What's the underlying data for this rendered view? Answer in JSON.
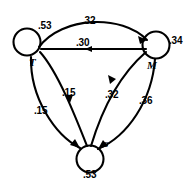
{
  "diagram": {
    "type": "state-transition-diagram",
    "nodes": [
      {
        "id": "T",
        "label": "T",
        "self_loop_label": ".53",
        "cx": 28,
        "cy": 42,
        "r": 14
      },
      {
        "id": "M",
        "label": "M",
        "self_loop_label": ".34",
        "cx": 155,
        "cy": 45,
        "r": 14
      },
      {
        "id": "S",
        "label": "s",
        "self_loop_label": ".53",
        "cx": 90,
        "cy": 158,
        "r": 14
      }
    ],
    "edges": [
      {
        "id": "T-M-top",
        "from": "T",
        "to": "M",
        "label": ".32"
      },
      {
        "id": "M-T-mid",
        "from": "M",
        "to": "T",
        "label": ".30"
      },
      {
        "id": "T-S-inner",
        "from": "T",
        "to": "S",
        "label": ".15"
      },
      {
        "id": "T-S-outer",
        "from": "T",
        "to": "S",
        "label": ".15"
      },
      {
        "id": "S-M-inner",
        "from": "S",
        "to": "M",
        "label": ".32"
      },
      {
        "id": "M-S-outer",
        "from": "M",
        "to": "S",
        "label": ".36"
      }
    ],
    "labels": {
      "t_loop": ".53",
      "m_loop": ".34",
      "s_loop": ".53",
      "top_arc": ".32",
      "mid_line": ".30",
      "left_inner": ".15",
      "left_outer": ".15",
      "right_inner": ".32",
      "right_outer": ".36",
      "node_t": "T",
      "node_m": "M",
      "node_s": "s"
    },
    "colors": {
      "stroke": "#000000",
      "background": "#ffffff"
    }
  }
}
